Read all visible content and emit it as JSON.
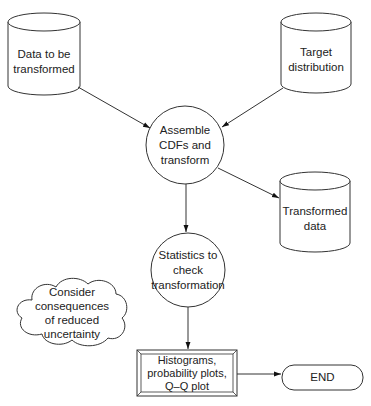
{
  "diagram": {
    "type": "flowchart",
    "nodes": {
      "data_to_transform": {
        "shape": "cylinder",
        "lines": [
          "Data to be",
          "transformed"
        ]
      },
      "target_distribution": {
        "shape": "cylinder",
        "lines": [
          "Target",
          "distribution"
        ]
      },
      "assemble": {
        "shape": "circle",
        "lines": [
          "Assemble",
          "CDFs and",
          "transform"
        ]
      },
      "transformed_data": {
        "shape": "cylinder",
        "lines": [
          "Transformed",
          "data"
        ]
      },
      "statistics": {
        "shape": "circle",
        "lines": [
          "Statistics to",
          "check",
          "transformation"
        ]
      },
      "consider": {
        "shape": "cloud",
        "lines": [
          "Consider",
          "consequences",
          "of reduced",
          "uncertainty"
        ]
      },
      "plots": {
        "shape": "double-border-rectangle",
        "lines": [
          "Histograms,",
          "probability plots,",
          "Q–Q plot"
        ]
      },
      "end": {
        "shape": "rounded-terminal",
        "lines": [
          "END"
        ]
      }
    },
    "edges": [
      {
        "from": "data_to_transform",
        "to": "assemble"
      },
      {
        "from": "target_distribution",
        "to": "assemble"
      },
      {
        "from": "assemble",
        "to": "transformed_data"
      },
      {
        "from": "assemble",
        "to": "statistics"
      },
      {
        "from": "statistics",
        "to": "plots"
      },
      {
        "from": "plots",
        "to": "end"
      }
    ],
    "colors": {
      "stroke": "#333333",
      "fill": "#ffffff",
      "text": "#222222"
    }
  }
}
